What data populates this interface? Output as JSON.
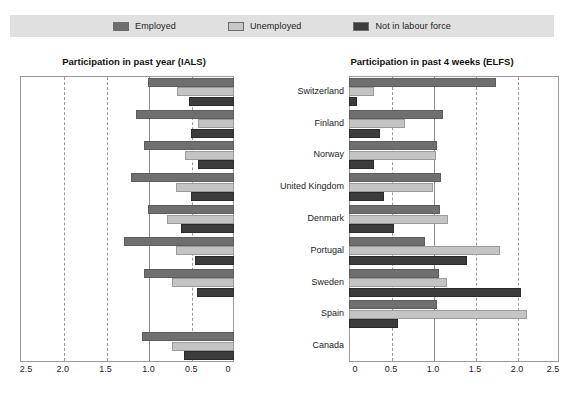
{
  "legend": {
    "items": [
      {
        "label": "Employed",
        "key": "employed",
        "color": "#6f6f6f"
      },
      {
        "label": "Unemployed",
        "key": "unemployed",
        "color": "#c4c4c4"
      },
      {
        "label": "Not in labour force",
        "key": "nilf",
        "color": "#3c3c3c"
      }
    ]
  },
  "chart_data": [
    {
      "type": "bar",
      "id": "ials",
      "title": "Participation in past year (IALS)",
      "orientation": "horizontal",
      "direction": "right-to-left",
      "xlabel": "",
      "ylabel": "",
      "xlim": [
        0,
        2.5
      ],
      "reversed_axis": true,
      "grid": true,
      "gridlines": [
        0.5,
        1.0,
        1.5,
        2.0
      ],
      "solid_gridline": 1.0,
      "tick_labels": [
        "2.5",
        "2.0",
        "1.5",
        "1.0",
        "0.5",
        "0"
      ],
      "ticks": [
        2.5,
        2.0,
        1.5,
        1.0,
        0.5,
        0
      ],
      "legend_position": "top",
      "categories": [
        "Switzerland",
        "Finland",
        "Norway",
        "United Kingdom",
        "Denmark",
        "Portugal",
        "Sweden",
        "Spain",
        "Canada"
      ],
      "series": [
        {
          "name": "Employed",
          "values": [
            1.0,
            1.15,
            1.05,
            1.2,
            1.0,
            1.28,
            1.05,
            null,
            1.08
          ]
        },
        {
          "name": "Unemployed",
          "values": [
            0.67,
            0.42,
            0.57,
            0.68,
            0.78,
            0.68,
            0.73,
            null,
            0.73
          ]
        },
        {
          "name": "Not in labour force",
          "values": [
            0.52,
            0.5,
            0.42,
            0.5,
            0.62,
            0.45,
            0.43,
            null,
            0.58
          ]
        }
      ]
    },
    {
      "type": "bar",
      "id": "elfs",
      "title": "Participation in past 4 weeks (ELFS)",
      "orientation": "horizontal",
      "direction": "left-to-right",
      "xlabel": "",
      "ylabel": "",
      "xlim": [
        0,
        2.5
      ],
      "reversed_axis": false,
      "grid": true,
      "gridlines": [
        0.5,
        1.0,
        1.5,
        2.0
      ],
      "solid_gridline": 1.0,
      "tick_labels": [
        "0",
        "0.5",
        "1.0",
        "1.5",
        "2.0",
        "2.5"
      ],
      "ticks": [
        0,
        0.5,
        1.0,
        1.5,
        2.0,
        2.5
      ],
      "legend_position": "top",
      "categories": [
        "Switzerland",
        "Finland",
        "Norway",
        "United Kingdom",
        "Denmark",
        "Portugal",
        "Sweden",
        "Spain",
        "Canada"
      ],
      "series": [
        {
          "name": "Employed",
          "values": [
            1.75,
            1.12,
            1.05,
            1.1,
            1.08,
            0.9,
            1.07,
            1.05,
            null
          ]
        },
        {
          "name": "Unemployed",
          "values": [
            0.3,
            0.67,
            1.03,
            1.0,
            1.18,
            1.8,
            1.17,
            2.12,
            null
          ]
        },
        {
          "name": "Not in labour force",
          "values": [
            0.1,
            0.37,
            0.3,
            0.42,
            0.53,
            1.4,
            2.05,
            0.58,
            null
          ]
        }
      ]
    }
  ]
}
